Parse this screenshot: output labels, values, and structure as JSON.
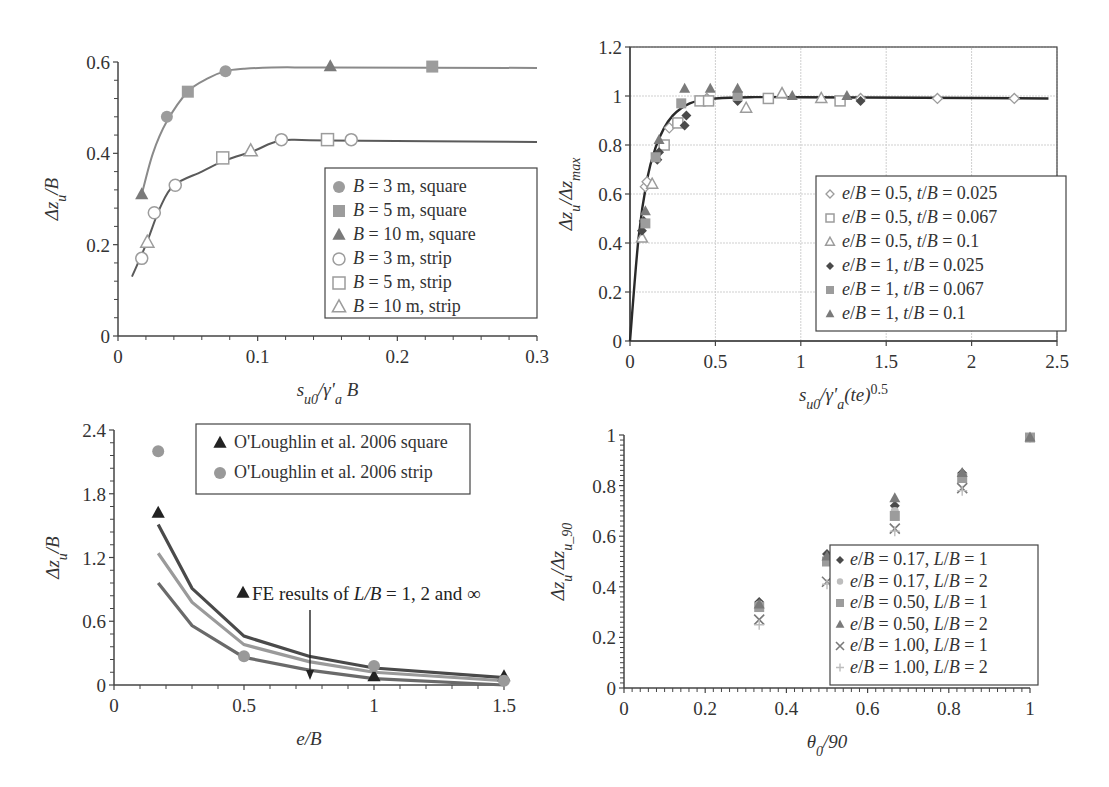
{
  "chart_data": [
    {
      "id": "top-left",
      "type": "scatter",
      "title": "",
      "xlabel": "s_u0/γ'_a B",
      "ylabel": "Δz_u/B",
      "xlim": [
        0,
        0.3
      ],
      "ylim": [
        0,
        0.6
      ],
      "xticks": [
        "0",
        "0.1",
        "0.2",
        "0.3"
      ],
      "yticks": [
        "0",
        "0.2",
        "0.4",
        "0.6"
      ],
      "grid": false,
      "legend_position": "center-right",
      "fit_curves": [
        {
          "name": "square fit",
          "x": [
            0.017,
            0.025,
            0.035,
            0.05,
            0.065,
            0.077,
            0.09,
            0.11,
            0.15,
            0.3
          ],
          "y": [
            0.31,
            0.4,
            0.47,
            0.535,
            0.565,
            0.58,
            0.585,
            0.588,
            0.588,
            0.587
          ]
        },
        {
          "name": "strip fit",
          "x": [
            0.01,
            0.02,
            0.03,
            0.04,
            0.06,
            0.077,
            0.097,
            0.117,
            0.15,
            0.3
          ],
          "y": [
            0.13,
            0.2,
            0.28,
            0.33,
            0.36,
            0.385,
            0.405,
            0.428,
            0.428,
            0.425
          ]
        }
      ],
      "series": [
        {
          "name": "B = 3 m, square",
          "marker": "filled-circle",
          "x": [
            0.035,
            0.077
          ],
          "y": [
            0.48,
            0.58
          ]
        },
        {
          "name": "B = 5 m, square",
          "marker": "filled-square",
          "x": [
            0.05,
            0.225
          ],
          "y": [
            0.535,
            0.59
          ]
        },
        {
          "name": "B = 10 m, square",
          "marker": "filled-triangle",
          "x": [
            0.017,
            0.152
          ],
          "y": [
            0.31,
            0.59
          ]
        },
        {
          "name": "B = 3 m, strip",
          "marker": "open-circle",
          "x": [
            0.017,
            0.026,
            0.041,
            0.117,
            0.167
          ],
          "y": [
            0.17,
            0.27,
            0.33,
            0.43,
            0.43
          ]
        },
        {
          "name": "B = 5 m, strip",
          "marker": "open-square",
          "x": [
            0.075,
            0.15
          ],
          "y": [
            0.39,
            0.43
          ]
        },
        {
          "name": "B = 10 m, strip",
          "marker": "open-triangle",
          "x": [
            0.021,
            0.095
          ],
          "y": [
            0.205,
            0.405
          ]
        }
      ]
    },
    {
      "id": "top-right",
      "type": "scatter",
      "title": "",
      "xlabel": "s_u0/γ'_a(te)^0.5",
      "ylabel": "Δz_u/Δz_max",
      "xlim": [
        0,
        2.5
      ],
      "ylim": [
        0,
        1.2
      ],
      "xticks": [
        "0",
        "0.5",
        "1",
        "1.5",
        "2",
        "2.5"
      ],
      "yticks": [
        "0",
        "0.2",
        "0.4",
        "0.6",
        "0.8",
        "1",
        "1.2"
      ],
      "grid": true,
      "legend_position": "center-right",
      "fit_curves": [
        {
          "name": "fit",
          "x": [
            0,
            0.05,
            0.1,
            0.15,
            0.2,
            0.25,
            0.3,
            0.35,
            0.4,
            0.5,
            0.7,
            1.0,
            2.45
          ],
          "y": [
            0,
            0.42,
            0.66,
            0.79,
            0.87,
            0.92,
            0.95,
            0.97,
            0.98,
            0.99,
            0.995,
            0.995,
            0.99
          ]
        }
      ],
      "series": [
        {
          "name": "e/B = 0.5, t/B = 0.025",
          "marker": "open-diamond",
          "x": [
            0.09,
            0.1,
            0.23,
            0.45,
            1.35,
            1.8,
            2.25
          ],
          "y": [
            0.63,
            0.65,
            0.87,
            0.99,
            0.99,
            0.99,
            0.99
          ]
        },
        {
          "name": "e/B = 0.5, t/B = 0.067",
          "marker": "open-square",
          "x": [
            0.2,
            0.28,
            0.41,
            0.46,
            0.81,
            1.23
          ],
          "y": [
            0.8,
            0.89,
            0.98,
            0.98,
            0.99,
            0.98
          ]
        },
        {
          "name": "e/B = 0.5, t/B = 0.1",
          "marker": "open-triangle",
          "x": [
            0.07,
            0.13,
            0.68,
            0.89,
            1.12
          ],
          "y": [
            0.42,
            0.64,
            0.95,
            1.01,
            0.99
          ]
        },
        {
          "name": "e/B = 1, t/B = 0.025",
          "marker": "filled-diamond",
          "x": [
            0.07,
            0.08,
            0.16,
            0.17,
            0.32,
            0.33,
            0.63,
            1.35
          ],
          "y": [
            0.45,
            0.49,
            0.74,
            0.77,
            0.88,
            0.92,
            0.98,
            0.98
          ]
        },
        {
          "name": "e/B = 1, t/B = 0.067",
          "marker": "filled-square",
          "x": [
            0.09,
            0.15,
            0.3,
            0.63
          ],
          "y": [
            0.48,
            0.75,
            0.97,
            1.0
          ]
        },
        {
          "name": "e/B = 1, t/B = 0.1",
          "marker": "filled-triangle",
          "x": [
            0.09,
            0.17,
            0.32,
            0.47,
            0.63,
            0.95,
            1.27
          ],
          "y": [
            0.53,
            0.82,
            1.03,
            1.03,
            1.03,
            1.0,
            1.0
          ]
        }
      ]
    },
    {
      "id": "bottom-left",
      "type": "line",
      "title": "",
      "xlabel": "e/B",
      "ylabel": "Δz_u/B",
      "xlim": [
        0,
        1.5
      ],
      "ylim": [
        0,
        2.4
      ],
      "xticks": [
        "0",
        "0.5",
        "1",
        "1.5"
      ],
      "yticks": [
        "0",
        "0.6",
        "1.2",
        "1.8",
        "2.4"
      ],
      "grid": false,
      "legend_position": "top-right",
      "annotation": "FE results of L/B = 1, 2 and ∞",
      "series": [
        {
          "name": "FE L/B = 1",
          "kind": "line",
          "color": "#4a4a4a",
          "x": [
            0.17,
            0.3,
            0.5,
            0.75,
            1.0,
            1.5
          ],
          "y": [
            1.51,
            0.91,
            0.46,
            0.27,
            0.16,
            0.07
          ]
        },
        {
          "name": "FE L/B = 2",
          "kind": "line",
          "color": "#9a9a9a",
          "x": [
            0.17,
            0.3,
            0.5,
            0.75,
            1.0,
            1.5
          ],
          "y": [
            1.24,
            0.78,
            0.38,
            0.22,
            0.12,
            0.04
          ]
        },
        {
          "name": "FE L/B = ∞",
          "kind": "line",
          "color": "#6a6a6a",
          "x": [
            0.17,
            0.3,
            0.5,
            0.75,
            1.0,
            1.5
          ],
          "y": [
            0.96,
            0.56,
            0.26,
            0.14,
            0.06,
            0.0
          ]
        },
        {
          "name": "O'Loughlin et al. 2006 square",
          "kind": "marker",
          "marker": "filled-triangle",
          "color": "#222222",
          "x": [
            0.17,
            1.0,
            1.5
          ],
          "y": [
            1.62,
            0.08,
            0.08
          ]
        },
        {
          "name": "O'Loughlin et al. 2006 strip",
          "kind": "marker",
          "marker": "filled-circle",
          "color": "#999999",
          "x": [
            0.17,
            0.5,
            1.0,
            1.5
          ],
          "y": [
            2.2,
            0.27,
            0.18,
            0.04
          ]
        }
      ]
    },
    {
      "id": "bottom-right",
      "type": "scatter",
      "title": "",
      "xlabel": "θ_0/90",
      "ylabel": "Δz_u/Δz_u_90",
      "xlim": [
        0,
        1
      ],
      "ylim": [
        0,
        1
      ],
      "xticks": [
        "0",
        "0.2",
        "0.4",
        "0.6",
        "0.8",
        "1"
      ],
      "yticks": [
        "0",
        "0.2",
        "0.4",
        "0.6",
        "0.8",
        "1"
      ],
      "grid": false,
      "legend_position": "lower-right",
      "series": [
        {
          "name": "e/B = 0.17, L/B = 1",
          "marker": "filled-diamond",
          "x": [
            0.333,
            0.5,
            0.667,
            0.833,
            1.0
          ],
          "y": [
            0.34,
            0.53,
            0.72,
            0.85,
            0.99
          ]
        },
        {
          "name": "e/B = 0.17, L/B = 2",
          "marker": "filled-circle-light",
          "x": [
            0.333,
            0.5,
            0.667,
            0.833,
            1.0
          ],
          "y": [
            0.33,
            0.51,
            0.7,
            0.84,
            0.99
          ]
        },
        {
          "name": "e/B = 0.50, L/B = 1",
          "marker": "filled-square",
          "x": [
            0.333,
            0.5,
            0.667,
            0.833,
            1.0
          ],
          "y": [
            0.32,
            0.5,
            0.68,
            0.83,
            0.99
          ]
        },
        {
          "name": "e/B = 0.50, L/B = 2",
          "marker": "filled-triangle",
          "x": [
            0.333,
            0.5,
            0.667,
            0.833,
            1.0
          ],
          "y": [
            0.33,
            0.52,
            0.75,
            0.85,
            0.99
          ]
        },
        {
          "name": "e/B = 1.00, L/B = 1",
          "marker": "x",
          "x": [
            0.333,
            0.5,
            0.667,
            0.833
          ],
          "y": [
            0.27,
            0.42,
            0.63,
            0.79
          ]
        },
        {
          "name": "e/B = 1.00, L/B = 2",
          "marker": "plus",
          "x": [
            0.333,
            0.5,
            0.667,
            0.833
          ],
          "y": [
            0.25,
            0.41,
            0.62,
            0.78
          ]
        }
      ]
    }
  ],
  "panels": {
    "top_left": {
      "legend": [
        "B = 3 m, square",
        "B = 5 m, square",
        "B = 10 m, square",
        "B = 3 m, strip",
        "B = 5 m, strip",
        "B = 10 m, strip"
      ]
    },
    "top_right": {
      "legend": [
        "e/B = 0.5, t/B = 0.025",
        "e/B = 0.5, t/B = 0.067",
        "e/B = 0.5, t/B = 0.1",
        "e/B = 1, t/B = 0.025",
        "e/B = 1, t/B = 0.067",
        "e/B = 1, t/B = 0.1"
      ]
    },
    "bottom_left": {
      "legend": [
        "O'Loughlin et al. 2006 square",
        "O'Loughlin et al. 2006 strip"
      ],
      "annotation": "FE results of L/B = 1, 2 and ∞"
    },
    "bottom_right": {
      "legend": [
        "e/B = 0.17, L/B = 1",
        "e/B = 0.17, L/B = 2",
        "e/B = 0.50, L/B = 1",
        "e/B = 0.50, L/B = 2",
        "e/B = 1.00, L/B = 1",
        "e/B = 1.00, L/B = 2"
      ]
    }
  },
  "colors": {
    "axis": "#444444",
    "grid": "#cfcfcf",
    "dark": "#4a4a4a",
    "mid": "#7a7a7a",
    "light": "#9c9c9c",
    "lighter": "#bdbdbd",
    "fit_square": "#8a8a8a",
    "fit_strip": "#5a5a5a",
    "fit_main": "#2a2a2a"
  }
}
